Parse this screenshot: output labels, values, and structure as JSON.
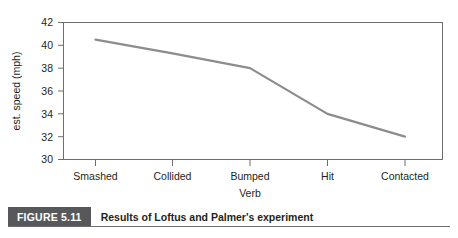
{
  "figure": {
    "number_label": "FIGURE 5.11",
    "caption": "Results of Loftus and Palmer's experiment"
  },
  "chart_data": {
    "type": "line",
    "title": "",
    "xlabel": "Verb",
    "ylabel": "est. speed (mph)",
    "categories": [
      "Smashed",
      "Collided",
      "Bumped",
      "Hit",
      "Contacted"
    ],
    "values": [
      40.5,
      39.3,
      38.0,
      34.0,
      32.0
    ],
    "series": [
      {
        "name": "est. speed (mph)",
        "values": [
          40.5,
          39.3,
          38.0,
          34.0,
          32.0
        ]
      }
    ],
    "ylim": [
      30,
      42
    ],
    "ytick_values": [
      30,
      32,
      34,
      36,
      38,
      40,
      42
    ],
    "ytick_labels": [
      "30",
      "32",
      "34",
      "36",
      "38",
      "40",
      "42"
    ],
    "xtick_labels": [
      "Smashed",
      "Collided",
      "Bumped",
      "Hit",
      "Contacted"
    ],
    "grid": false,
    "legend": false,
    "legend_position": "none",
    "line_color": "#8c8c8c",
    "frame_color": "#6d6e71",
    "text_color": "#231f20"
  },
  "axis": {
    "y_ticks": [
      "42",
      "40",
      "38",
      "36",
      "34",
      "32",
      "30"
    ],
    "y_title": "est. speed (mph)",
    "x_title": "Verb",
    "x_ticks": [
      "Smashed",
      "Collided",
      "Bumped",
      "Hit",
      "Contacted"
    ]
  }
}
